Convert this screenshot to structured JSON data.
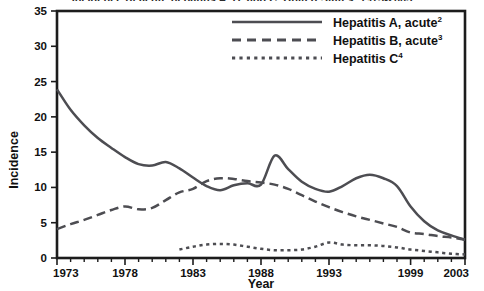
{
  "figure": {
    "cropped_title_fragment": "Incidence of acute hepatitis A, B, and C, United States, 1973-2003"
  },
  "axes": {
    "y_title": "Incidence",
    "x_title": "Year",
    "y_ticks": [
      "0",
      "5",
      "10",
      "15",
      "20",
      "25",
      "30",
      "35"
    ],
    "x_ticks": [
      "1973",
      "1978",
      "1983",
      "1988",
      "1993",
      "1999",
      "2003"
    ]
  },
  "legend": [
    {
      "label": "Hepatitis A, acute",
      "superscript": "2",
      "style": "solid",
      "swatch": "legend-swatch-a",
      "name": "legend-item-hepatitis-a"
    },
    {
      "label": "Hepatitis B, acute",
      "superscript": "3",
      "style": "dashed",
      "swatch": "legend-swatch-b",
      "name": "legend-item-hepatitis-b"
    },
    {
      "label": "Hepatitis C",
      "superscript": "4",
      "style": "dotted",
      "swatch": "legend-swatch-c",
      "name": "legend-item-hepatitis-c"
    }
  ],
  "colors": {
    "series": "#4d4d52",
    "axis": "#1c1c1c",
    "text": "#111111",
    "background": "#ffffff"
  },
  "chart_data": {
    "type": "line",
    "title": "",
    "xlabel": "Year",
    "ylabel": "Incidence",
    "xlim": [
      1973,
      2003
    ],
    "ylim": [
      0,
      35
    ],
    "yticks": [
      0,
      5,
      10,
      15,
      20,
      25,
      30,
      35
    ],
    "xticks": [
      1973,
      1978,
      1983,
      1988,
      1993,
      1999,
      2003
    ],
    "grid": false,
    "legend_position": "top-right",
    "x": [
      1973,
      1974,
      1975,
      1976,
      1977,
      1978,
      1979,
      1980,
      1981,
      1982,
      1983,
      1984,
      1985,
      1986,
      1987,
      1988,
      1989,
      1990,
      1991,
      1992,
      1993,
      1994,
      1995,
      1996,
      1997,
      1998,
      1999,
      2000,
      2001,
      2002,
      2003
    ],
    "series": [
      {
        "name": "Hepatitis A, acute",
        "superscript": "2",
        "style": "solid",
        "values": [
          23.9,
          21.0,
          18.8,
          17.0,
          15.6,
          14.3,
          13.3,
          13.1,
          13.6,
          12.7,
          11.4,
          10.2,
          9.6,
          10.3,
          10.6,
          10.4,
          14.5,
          12.6,
          10.8,
          9.8,
          9.4,
          10.2,
          11.3,
          11.8,
          11.3,
          10.2,
          7.3,
          5.2,
          3.9,
          3.2,
          2.6
        ]
      },
      {
        "name": "Hepatitis B, acute",
        "superscript": "3",
        "style": "dashed",
        "values": [
          4.1,
          4.8,
          5.4,
          6.1,
          6.8,
          7.3,
          6.9,
          7.1,
          8.2,
          9.3,
          9.8,
          10.9,
          11.3,
          11.2,
          10.9,
          10.7,
          10.4,
          9.8,
          8.9,
          8.0,
          7.2,
          6.5,
          5.9,
          5.4,
          4.9,
          4.4,
          3.6,
          3.4,
          3.1,
          2.9,
          2.6
        ]
      },
      {
        "name": "Hepatitis C",
        "superscript": "4",
        "style": "dotted",
        "values": [
          null,
          null,
          null,
          null,
          null,
          null,
          null,
          null,
          null,
          1.2,
          1.6,
          1.9,
          2.0,
          1.9,
          1.6,
          1.3,
          1.1,
          1.1,
          1.2,
          1.6,
          2.2,
          1.9,
          1.8,
          1.8,
          1.7,
          1.5,
          1.2,
          1.0,
          0.8,
          0.6,
          0.5
        ]
      }
    ]
  }
}
